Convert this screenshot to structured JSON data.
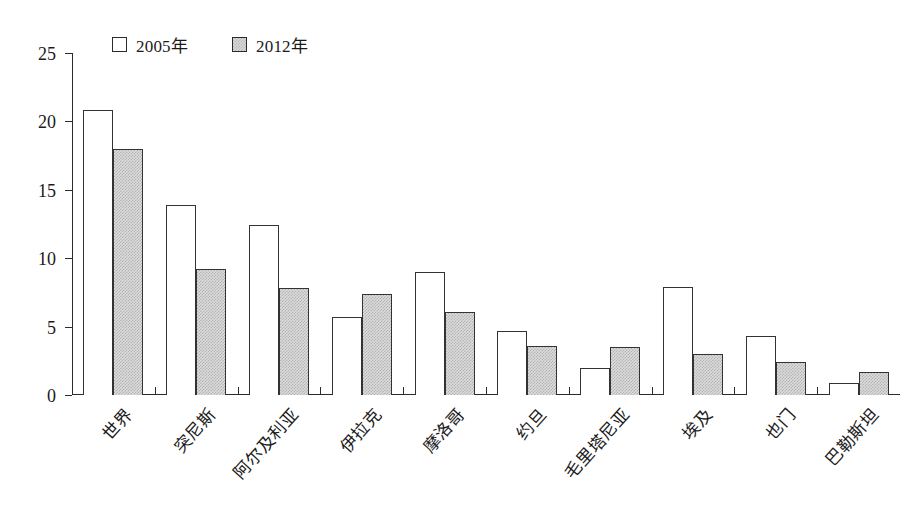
{
  "chart_data": {
    "type": "bar",
    "title": "",
    "subtitle": "",
    "xlabel": "",
    "ylabel": "",
    "ylim": [
      0,
      25
    ],
    "yticks": [
      0,
      5,
      10,
      15,
      20,
      25
    ],
    "grid": false,
    "legend_position": "top-left",
    "categories": [
      "世界",
      "突尼斯",
      "阿尔及利亚",
      "伊拉克",
      "摩洛哥",
      "约旦",
      "毛里塔尼亚",
      "埃及",
      "也门",
      "巴勒斯坦"
    ],
    "series": [
      {
        "name": "2005年",
        "color": "#ffffff",
        "values": [
          20.8,
          13.9,
          12.4,
          5.7,
          9.0,
          4.7,
          2.0,
          7.9,
          4.3,
          0.9
        ]
      },
      {
        "name": "2012年",
        "color": "#dcdcdc",
        "values": [
          18.0,
          9.2,
          7.8,
          7.4,
          6.1,
          3.6,
          3.5,
          3.0,
          2.4,
          1.7
        ]
      }
    ]
  },
  "axes": {
    "y_tick_labels": [
      "0",
      "5",
      "10",
      "15",
      "20",
      "25"
    ]
  },
  "legend": {
    "items": [
      {
        "label": "2005年",
        "swatch": "white-square"
      },
      {
        "label": "2012年",
        "swatch": "gray-square"
      }
    ]
  }
}
